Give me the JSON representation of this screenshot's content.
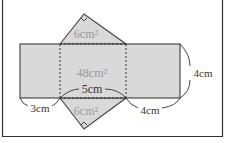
{
  "diagram": {
    "type": "triangular-prism-net",
    "colors": {
      "fill": "#d9d9d9",
      "stroke": "#4a4a4a",
      "area_label": "#9a9a9a",
      "dim_label": "#333333",
      "frame": "#333333",
      "background": "#ffffff"
    },
    "faces": {
      "top_triangle_area": "6cm²",
      "middle_rectangle_area": "48cm²",
      "bottom_triangle_area": "6cm²"
    },
    "dimensions": {
      "hypotenuse": "5cm",
      "left_leg": "3cm",
      "right_leg": "4cm",
      "height": "4cm"
    },
    "markers": {
      "top_right_angle": "right-angle-marker",
      "bottom_right_angle": "right-angle-marker"
    }
  }
}
